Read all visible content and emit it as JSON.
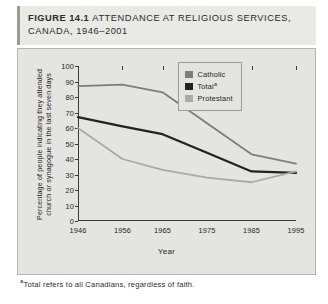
{
  "figure": {
    "label_word": "FIGURE",
    "number": "14.1",
    "title": "ATTENDANCE AT RELIGIOUS SERVICES, CANADA, 1946–2001"
  },
  "footnote": {
    "marker": "a",
    "text": "Total refers to all Canadians, regardless of faith."
  },
  "legend": {
    "entries": [
      {
        "label": "Catholic",
        "color": "#7d7d7a"
      },
      {
        "label": "Total",
        "marker": "a",
        "color": "#222222"
      },
      {
        "label": "Protestant",
        "color": "#a9a9a6"
      }
    ]
  },
  "chart_data": {
    "type": "line",
    "title": "ATTENDANCE AT RELIGIOUS SERVICES, CANADA, 1946–2001",
    "xlabel": "Year",
    "ylabel": "Percentage of people indicating they attended church or synagogue in the last seven days",
    "x": [
      1946,
      1956,
      1965,
      1975,
      1985,
      1995
    ],
    "xticklabels": [
      "1946",
      "1956",
      "1965",
      "1975",
      "1985",
      "1995"
    ],
    "yticks": [
      0,
      10,
      20,
      30,
      40,
      50,
      60,
      70,
      80,
      90,
      100
    ],
    "ylim": [
      0,
      100
    ],
    "xlim": [
      1946,
      1995
    ],
    "grid": false,
    "legend_position": "upper-right-inside",
    "series": [
      {
        "name": "Catholic",
        "color": "#7d7d7a",
        "width": 1.8,
        "values": [
          87,
          88,
          83,
          63,
          43,
          37
        ]
      },
      {
        "name": "Total",
        "color": "#222222",
        "width": 2.2,
        "values": [
          67,
          61,
          56,
          44,
          32,
          31
        ]
      },
      {
        "name": "Protestant",
        "color": "#a9a9a6",
        "width": 1.8,
        "values": [
          60,
          40,
          33,
          28,
          25,
          32
        ]
      }
    ]
  }
}
